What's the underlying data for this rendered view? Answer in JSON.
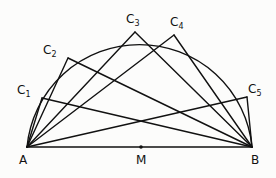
{
  "diagram": {
    "stroke_color": "#111111",
    "background": "#fcfcfb",
    "points": {
      "A": {
        "label": "A",
        "x": 27,
        "y": 147
      },
      "B": {
        "label": "B",
        "x": 252,
        "y": 147
      },
      "M": {
        "label": "M",
        "x": 141,
        "y": 147
      },
      "C1": {
        "label": "C",
        "sub": "1",
        "x": 42,
        "y": 98
      },
      "C2": {
        "label": "C",
        "sub": "2",
        "x": 68,
        "y": 58
      },
      "C3": {
        "label": "C",
        "sub": "3",
        "x": 135,
        "y": 32
      },
      "C4": {
        "label": "C",
        "sub": "4",
        "x": 174,
        "y": 35
      },
      "C5": {
        "label": "C",
        "sub": "5",
        "x": 247,
        "y": 97
      }
    },
    "labels": {
      "A": "A",
      "B": "B",
      "M": "M",
      "C1": "C",
      "C1_sub": "1",
      "C2": "C",
      "C2_sub": "2",
      "C3": "C",
      "C3_sub": "3",
      "C4": "C",
      "C4_sub": "4",
      "C5": "C",
      "C5_sub": "5"
    },
    "segments": [
      [
        "A",
        "B"
      ],
      [
        "A",
        "C1"
      ],
      [
        "C1",
        "B"
      ],
      [
        "A",
        "C2"
      ],
      [
        "C2",
        "B"
      ],
      [
        "A",
        "C3"
      ],
      [
        "C3",
        "B"
      ],
      [
        "A",
        "C4"
      ],
      [
        "C4",
        "B"
      ],
      [
        "A",
        "C5"
      ],
      [
        "C5",
        "B"
      ]
    ],
    "arc": {
      "center": "M",
      "radius": 113,
      "type": "semicircle-upper"
    }
  }
}
